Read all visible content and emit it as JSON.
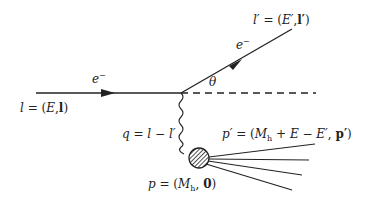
{
  "diagram": {
    "type": "feynman",
    "labels": {
      "incoming_particle": "e⁻",
      "incoming_momentum": "l = (E, l)",
      "outgoing_particle": "e⁻",
      "outgoing_momentum": "l′ = (E′, l′)",
      "scattering_angle": "θ",
      "exchanged_momentum": "q = l − l′",
      "target_momentum": "p = (Mh, 0)",
      "final_hadronic_momentum": "p′ = (Mh + E − E′, p′)"
    },
    "parts": {
      "l": "l",
      "eq": " = (",
      "E": "E",
      "comma": ",",
      "close": ")",
      "lprime": "l′",
      "Eprime": "E′",
      "theta": "θ",
      "eminus": "e",
      "minus_sup": "−",
      "q": "q",
      "q_rhs": " = l − l′",
      "p": "p",
      "M": "M",
      "h": "h",
      "zero": "0",
      "pprime": "p′",
      "plus_E_minus_Eprime": " + E − E′",
      "open": " = (",
      "comma_sp": ", "
    },
    "colors": {
      "line": "#222222",
      "background": "#ffffff"
    },
    "outgoing_hadron_lines": 4
  }
}
